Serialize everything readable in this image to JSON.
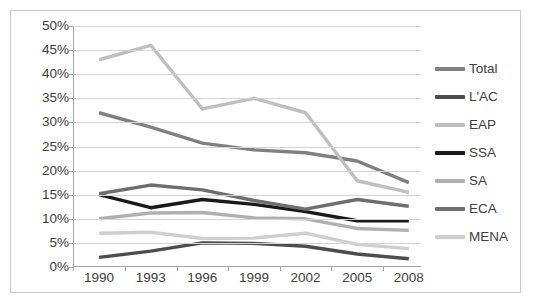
{
  "chart_data": {
    "type": "line",
    "title": "",
    "xlabel": "",
    "ylabel": "",
    "categories": [
      "1990",
      "1993",
      "1996",
      "1999",
      "2002",
      "2005",
      "2008"
    ],
    "ylim": [
      0,
      50
    ],
    "ytick_values": [
      0,
      5,
      10,
      15,
      20,
      25,
      30,
      35,
      40,
      45,
      50
    ],
    "ytick_labels": [
      "0%",
      "5%",
      "10%",
      "15%",
      "20%",
      "25%",
      "30%",
      "35%",
      "40%",
      "45%",
      "50%"
    ],
    "grid": true,
    "legend_position": "right",
    "value_suffix": "%",
    "series": [
      {
        "name": "Total",
        "color": "#808080",
        "values": [
          32.0,
          29.0,
          25.7,
          24.3,
          23.7,
          22.0,
          17.5
        ]
      },
      {
        "name": "L'AC",
        "color": "#4d4d4d",
        "values": [
          2.0,
          3.3,
          5.0,
          4.9,
          4.3,
          2.7,
          1.7
        ]
      },
      {
        "name": "EAP",
        "color": "#bfbfbf",
        "values": [
          43.0,
          46.0,
          32.8,
          35.0,
          32.0,
          17.9,
          15.5
        ]
      },
      {
        "name": "SSA",
        "color": "#1a1a1a",
        "values": [
          15.0,
          12.3,
          14.0,
          13.0,
          11.5,
          9.6,
          9.6
        ]
      },
      {
        "name": "SA",
        "color": "#b0b0b0",
        "values": [
          10.0,
          11.2,
          11.3,
          10.2,
          10.0,
          8.0,
          7.6
        ]
      },
      {
        "name": "ECA",
        "color": "#6e6e6e",
        "values": [
          15.2,
          17.0,
          16.0,
          13.8,
          12.0,
          14.0,
          12.6
        ]
      },
      {
        "name": "MENA",
        "color": "#cfcfcf",
        "values": [
          7.0,
          7.2,
          5.9,
          6.0,
          7.0,
          4.7,
          3.8
        ]
      }
    ]
  },
  "legend": {
    "items": [
      {
        "label": "Total"
      },
      {
        "label": "L'AC"
      },
      {
        "label": "EAP"
      },
      {
        "label": "SSA"
      },
      {
        "label": "SA"
      },
      {
        "label": "ECA"
      },
      {
        "label": "MENA"
      }
    ]
  },
  "title_strip": ""
}
